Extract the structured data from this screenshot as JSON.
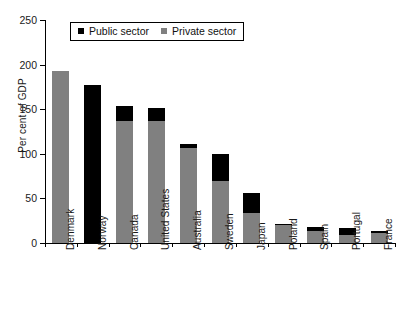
{
  "chart_data": {
    "type": "bar",
    "title": "",
    "subtitle": "",
    "xlabel": "",
    "ylabel": "Per cent of GDP",
    "ylim": [
      0,
      250
    ],
    "yticks": [
      0,
      50,
      100,
      150,
      200,
      250
    ],
    "grid": false,
    "stacked": true,
    "legend_position": "top-left-inside",
    "categories": [
      "Denmark",
      "Norway",
      "Canada",
      "United States",
      "Australia",
      "Sweden",
      "Japan",
      "Poland",
      "Spain",
      "Portugal",
      "France"
    ],
    "series": [
      {
        "name": "Private sector",
        "color": "#808080",
        "values": [
          193,
          0,
          137,
          137,
          107,
          70,
          34,
          20,
          13,
          9,
          11
        ]
      },
      {
        "name": "Public sector",
        "color": "#000000",
        "values": [
          0,
          177,
          17,
          14,
          4,
          30,
          22,
          1,
          5,
          8,
          2
        ]
      }
    ],
    "totals": [
      193,
      177,
      154,
      151,
      111,
      100,
      56,
      21,
      18,
      17,
      13
    ]
  },
  "legend": {
    "entries": [
      {
        "label": "Public sector",
        "color": "#000000"
      },
      {
        "label": "Private sector",
        "color": "#808080"
      }
    ]
  },
  "axis": {
    "y_title": "Per cent of GDP",
    "y_tick_labels": [
      "250",
      "200",
      "150",
      "100",
      "50",
      "0"
    ]
  }
}
